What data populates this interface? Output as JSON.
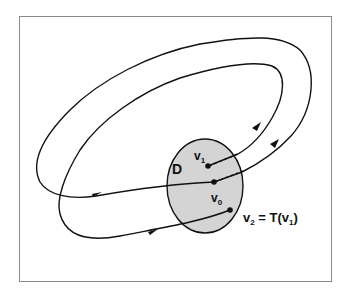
{
  "diagram": {
    "type": "poincare-map-illustration",
    "frame": {
      "stroke": "#8a8a8a"
    },
    "section": {
      "label": "D",
      "fill": "#d4d4d4",
      "stroke": "#111111"
    },
    "points": [
      {
        "id": "v1",
        "label_base": "v",
        "label_sub": "1"
      },
      {
        "id": "v0",
        "label_base": "v",
        "label_sub": "0"
      },
      {
        "id": "v2",
        "label_base": "v",
        "label_sub": "2"
      }
    ],
    "equation": {
      "lhs_base": "v",
      "lhs_sub": "2",
      "op": " = T(",
      "arg_base": "v",
      "arg_sub": "1",
      "close": ")"
    },
    "trajectories": [
      {
        "name": "outer-orbit",
        "from": "v0",
        "to": "v1"
      },
      {
        "name": "inner-orbit",
        "from": "v1",
        "to": "v2"
      }
    ]
  }
}
